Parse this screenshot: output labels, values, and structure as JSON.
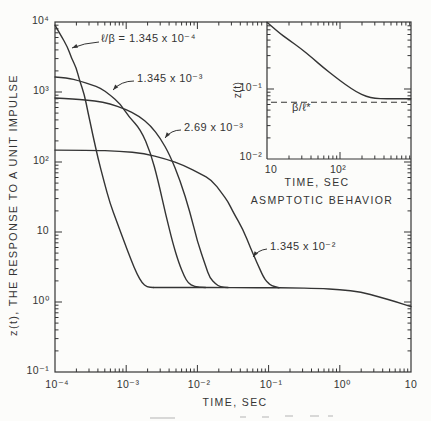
{
  "colors": {
    "ink": "#343434",
    "paper": "#fcfcfa"
  },
  "chart_data": {
    "type": "line",
    "title": "",
    "xlabel": "TIME, SEC",
    "ylabel": "z(t), THE RESPONSE TO A UNIT IMPULSE",
    "xscale": "log",
    "yscale": "log",
    "xlim": [
      0.0001,
      10
    ],
    "ylim": [
      0.1,
      10000
    ],
    "grid": false,
    "legend": "inline labels with leader arrows",
    "x_ticks": [
      "10⁻⁴",
      "10⁻³",
      "10⁻²",
      "10⁻¹",
      "10⁰",
      "10"
    ],
    "y_ticks": [
      "10⁴",
      "10³",
      "10²",
      "10",
      "10⁰",
      "10⁻¹"
    ],
    "series": [
      {
        "name": "ℓ/β = 1.345 x 10⁻⁴",
        "points": [
          [
            0.0001,
            9000
          ],
          [
            0.00012,
            6500
          ],
          [
            0.00015,
            4400
          ],
          [
            0.00017,
            3060
          ],
          [
            0.0002,
            2200
          ],
          [
            0.00022,
            1480
          ],
          [
            0.00026,
            906
          ],
          [
            0.00029,
            518
          ],
          [
            0.00034,
            243
          ],
          [
            0.0004,
            114
          ],
          [
            0.00049,
            52
          ],
          [
            0.00059,
            26
          ],
          [
            0.00074,
            13.9
          ],
          [
            0.00093,
            7.4
          ],
          [
            0.00117,
            4.0
          ],
          [
            0.00142,
            2.5
          ],
          [
            0.00167,
            1.87
          ],
          [
            0.00196,
            1.64
          ],
          [
            0.0024,
            1.61
          ]
        ]
      },
      {
        "name": "1.345 x 10⁻³",
        "points": [
          [
            0.0001,
            1640
          ],
          [
            0.00015,
            1590
          ],
          [
            0.00022,
            1440
          ],
          [
            0.00033,
            1260
          ],
          [
            0.00043,
            1150
          ],
          [
            0.00059,
            910
          ],
          [
            0.00082,
            680
          ],
          [
            0.0011,
            440
          ],
          [
            0.0016,
            290
          ],
          [
            0.0022,
            135
          ],
          [
            0.0028,
            55
          ],
          [
            0.0036,
            17.5
          ],
          [
            0.0045,
            7.0
          ],
          [
            0.0055,
            3.6
          ],
          [
            0.0065,
            2.35
          ],
          [
            0.0074,
            1.87
          ],
          [
            0.009,
            1.65
          ],
          [
            0.013,
            1.61
          ]
        ]
      },
      {
        "name": "2.69 x 10⁻³",
        "points": [
          [
            0.0001,
            820
          ],
          [
            0.00019,
            795
          ],
          [
            0.00037,
            745
          ],
          [
            0.00059,
            680
          ],
          [
            0.00096,
            575
          ],
          [
            0.0015,
            455
          ],
          [
            0.0022,
            330
          ],
          [
            0.003,
            220
          ],
          [
            0.0041,
            126
          ],
          [
            0.0057,
            55
          ],
          [
            0.0079,
            19
          ],
          [
            0.01,
            7.2
          ],
          [
            0.013,
            3.3
          ],
          [
            0.015,
            2.2
          ],
          [
            0.018,
            1.8
          ],
          [
            0.021,
            1.64
          ],
          [
            0.027,
            1.61
          ]
        ]
      },
      {
        "name": "1.345 x 10⁻²",
        "points": [
          [
            0.0001,
            148
          ],
          [
            0.00031,
            148
          ],
          [
            0.00082,
            143
          ],
          [
            0.0018,
            132
          ],
          [
            0.0035,
            112
          ],
          [
            0.0067,
            88
          ],
          [
            0.011,
            68
          ],
          [
            0.016,
            55
          ],
          [
            0.022,
            36
          ],
          [
            0.027,
            27
          ],
          [
            0.032,
            19
          ],
          [
            0.044,
            10.7
          ],
          [
            0.055,
            6.1
          ],
          [
            0.069,
            3.6
          ],
          [
            0.084,
            2.3
          ],
          [
            0.095,
            1.93
          ],
          [
            0.11,
            1.7
          ],
          [
            0.14,
            1.6
          ]
        ]
      },
      {
        "name": "common asymptote",
        "points": [
          [
            0.0024,
            1.61
          ],
          [
            0.005,
            1.61
          ],
          [
            0.01,
            1.61
          ],
          [
            0.02,
            1.61
          ],
          [
            0.05,
            1.6
          ],
          [
            0.1,
            1.6
          ],
          [
            0.2,
            1.59
          ],
          [
            0.5,
            1.57
          ],
          [
            1,
            1.5
          ],
          [
            2,
            1.39
          ],
          [
            3.6,
            1.18
          ],
          [
            6.3,
            1.0
          ],
          [
            10,
            0.86
          ]
        ]
      }
    ],
    "inset": {
      "title": "ASMPTOTIC BEHAVIOR",
      "xlabel": "TIME, SEC",
      "ylabel": "z(t)",
      "xscale": "log",
      "yscale": "log",
      "xlim": [
        10,
        1000
      ],
      "ylim": [
        0.01,
        0.9
      ],
      "x_ticks": [
        "10",
        "10²"
      ],
      "y_ticks": [
        "10⁻¹",
        "10⁻²"
      ],
      "asymptote_label": "β/ℓ*",
      "asymptote_value": 0.0645,
      "series": [
        {
          "name": "z(t) asymptotic decay",
          "points": [
            [
              10,
              0.9
            ],
            [
              14,
              0.66
            ],
            [
              20,
              0.5
            ],
            [
              29,
              0.38
            ],
            [
              42,
              0.275
            ],
            [
              60,
              0.2
            ],
            [
              85,
              0.15
            ],
            [
              120,
              0.115
            ],
            [
              170,
              0.09
            ],
            [
              230,
              0.078
            ],
            [
              300,
              0.0735
            ],
            [
              420,
              0.0725
            ],
            [
              930,
              0.0725
            ]
          ]
        }
      ]
    }
  }
}
